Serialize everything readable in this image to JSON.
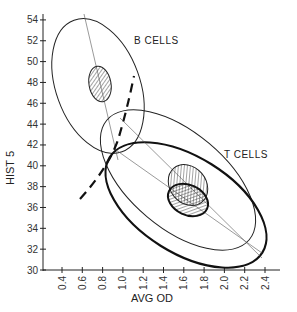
{
  "chart_data": {
    "type": "scatter",
    "title": "",
    "xlabel": "AVG OD",
    "ylabel": "HIST 5",
    "xlim": [
      0.3,
      2.5
    ],
    "ylim": [
      30,
      54
    ],
    "x_ticks": [
      "0.4",
      "0.6",
      "0.8",
      "1.0",
      "1.2",
      "1.4",
      "1.6",
      "1.8",
      "2.0",
      "2.2",
      "2.4"
    ],
    "y_ticks": [
      "30",
      "32",
      "34",
      "36",
      "38",
      "40",
      "42",
      "44",
      "46",
      "48",
      "50",
      "52",
      "54"
    ],
    "grid": false,
    "annotations": [
      "B CELLS",
      "T CELLS"
    ],
    "regions": [
      {
        "name": "B CELLS outer ellipse",
        "center": [
          0.8,
          47.5
        ],
        "style": "thin outline"
      },
      {
        "name": "B CELLS core (hatched)",
        "center": [
          0.8,
          48.0
        ],
        "style": "hatched"
      },
      {
        "name": "T CELLS outer ellipse (thin)",
        "center": [
          1.6,
          38.5
        ],
        "style": "thin outline"
      },
      {
        "name": "T CELLS outer ellipse (bold)",
        "center": [
          1.6,
          36.5
        ],
        "style": "bold outline"
      },
      {
        "name": "T CELLS core (hatched, thin)",
        "center": [
          1.6,
          38.8
        ],
        "style": "hatched"
      },
      {
        "name": "T CELLS core (hatched, bold)",
        "center": [
          1.6,
          36.7
        ],
        "style": "hatched bold"
      },
      {
        "name": "discriminant boundary",
        "style": "dashed curve",
        "from": [
          0.6,
          37
        ],
        "to": [
          1.3,
          48
        ]
      }
    ]
  },
  "labels": {
    "b_cells": "B CELLS",
    "t_cells": "T CELLS",
    "xlabel": "AVG OD",
    "ylabel": "HIST 5"
  }
}
